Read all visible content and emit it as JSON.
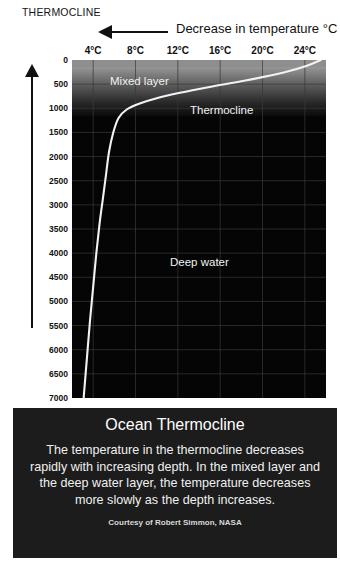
{
  "doc": {
    "title": "THERMOCLINE"
  },
  "axes": {
    "x_note": "Decrease in  temperature °C",
    "x_arrow": "left-arrow",
    "y_label": "Depth in meters",
    "y_arrow": "up-arrow"
  },
  "plot_labels": {
    "mixed_layer": "Mixed layer",
    "thermocline": "Thermocline",
    "deep_water": "Deep water"
  },
  "caption": {
    "heading": "Ocean Thermocline",
    "body": "The temperature in the thermocline decreases rapidly with increasing depth. In the mixed layer and the deep water layer, the temperature decreases more slowly as the depth increases.",
    "credit": "Courtesy of Robert Simmon, NASA"
  },
  "chart_data": {
    "type": "line",
    "title": "THERMOCLINE",
    "xlabel": "Decrease in  temperature °C",
    "ylabel": "Depth in meters",
    "xlim": [
      2,
      26
    ],
    "ylim": [
      0,
      7000
    ],
    "y_inverted": true,
    "grid": true,
    "legend": "none",
    "x_ticks": [
      "4°C",
      "8°C",
      "12°C",
      "16°C",
      "20°C",
      "24°C"
    ],
    "x_tick_values": [
      4,
      8,
      12,
      16,
      20,
      24
    ],
    "y_ticks": [
      "0",
      "500",
      "1000",
      "1500",
      "2000",
      "2500",
      "3000",
      "3500",
      "4000",
      "4500",
      "5000",
      "5500",
      "6000",
      "6500",
      "7000"
    ],
    "y_tick_values": [
      0,
      500,
      1000,
      1500,
      2000,
      2500,
      3000,
      3500,
      4000,
      4500,
      5000,
      5500,
      6000,
      6500,
      7000
    ],
    "series": [
      {
        "name": "Ocean temperature profile",
        "color": "#f2f2f2",
        "x": [
          25.5,
          24.2,
          22.0,
          18.5,
          15.0,
          12.2,
          10.0,
          8.4,
          7.2,
          6.4,
          5.9,
          5.5,
          5.2,
          4.9,
          4.6,
          4.3,
          4.0,
          3.7,
          3.4,
          3.1
        ],
        "y": [
          0,
          120,
          260,
          420,
          560,
          680,
          790,
          900,
          1020,
          1200,
          1500,
          1900,
          2400,
          2900,
          3400,
          4000,
          4700,
          5400,
          6200,
          7000
        ]
      }
    ],
    "regions": [
      {
        "label": "Mixed layer",
        "depth_from": 0,
        "depth_to": 600
      },
      {
        "label": "Thermocline",
        "depth_from": 600,
        "depth_to": 1200
      },
      {
        "label": "Deep water",
        "depth_from": 1200,
        "depth_to": 7000
      }
    ],
    "annotations": [
      {
        "text": "Mixed layer",
        "x": 13,
        "y": 320
      },
      {
        "text": "Thermocline",
        "x": 19,
        "y": 930
      },
      {
        "text": "Deep water",
        "x": 14,
        "y": 4080
      }
    ]
  }
}
